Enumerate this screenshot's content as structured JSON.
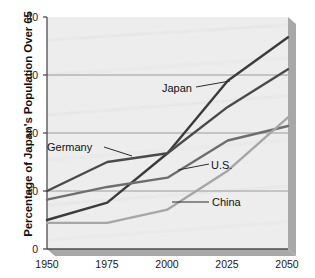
{
  "chart_data": {
    "type": "line",
    "title": "",
    "subtitle": "",
    "xlabel": "",
    "ylabel": "Percentage of Japan's Population Over 65",
    "x": [
      1950,
      1975,
      2000,
      2025,
      2050
    ],
    "xtick_labels": [
      "1950",
      "1975",
      "2000",
      "2025",
      "2050"
    ],
    "ytick_labels": [
      "0",
      "10",
      "20",
      "30",
      "40"
    ],
    "ytick_values": [
      0,
      10,
      20,
      30,
      40
    ],
    "xlim": [
      1950,
      2050
    ],
    "ylim": [
      0,
      40
    ],
    "grid": "horizontal",
    "legend_position": "inline-annotations",
    "series": [
      {
        "name": "Japan",
        "color": "#3b3b3b",
        "values": [
          5.0,
          8.0,
          16.5,
          29.0,
          36.5
        ]
      },
      {
        "name": "Germany",
        "color": "#4a4a4a",
        "values": [
          10.0,
          15.0,
          16.5,
          24.5,
          31.0
        ]
      },
      {
        "name": "U.S.",
        "color": "#6e6e6e",
        "values": [
          8.5,
          10.7,
          12.3,
          18.7,
          21.2
        ]
      },
      {
        "name": "China",
        "color": "#a6a6a6",
        "values": [
          4.5,
          4.5,
          6.8,
          13.5,
          22.7
        ]
      }
    ],
    "annotations": [
      {
        "text": "Japan",
        "label_x": 162,
        "label_y": 82,
        "leader_from_x": 196,
        "leader_from_y": 87,
        "leader_to_x": 230,
        "leader_to_y": 81
      },
      {
        "text": "Germany",
        "label_x": 47,
        "label_y": 141,
        "leader_from_x": 104,
        "leader_from_y": 147,
        "leader_to_x": 132,
        "leader_to_y": 156
      },
      {
        "text": "U.S.",
        "label_x": 211,
        "label_y": 159,
        "leader_from_x": 178,
        "leader_from_y": 170,
        "leader_to_x": 209,
        "leader_to_y": 164
      },
      {
        "text": "China",
        "label_x": 212,
        "label_y": 196,
        "leader_from_x": 172,
        "leader_from_y": 202,
        "leader_to_x": 209,
        "leader_to_y": 202
      }
    ]
  },
  "colors": {
    "plot_background": "#eeeeee",
    "grid_line": "#9a9a9a",
    "axis_line": "#4d4d4d",
    "shadow": "#a8a8a8",
    "text": "#111111"
  }
}
